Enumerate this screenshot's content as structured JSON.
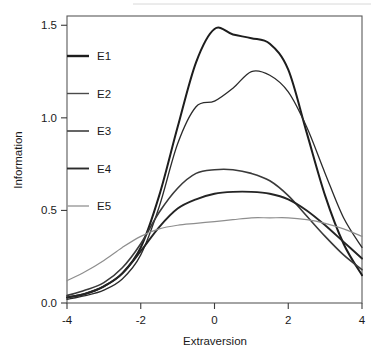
{
  "chart_data": {
    "type": "line",
    "title": "",
    "xlabel": "Extraversion",
    "ylabel": "Information",
    "xlim": [
      -4,
      4
    ],
    "ylim": [
      0.0,
      1.55
    ],
    "xticks": [
      -4,
      -2,
      0,
      2,
      4
    ],
    "xtick_labels": [
      "-4",
      "-2",
      "0",
      "2",
      "4"
    ],
    "yticks": [
      0.0,
      0.5,
      1.0,
      1.5
    ],
    "ytick_labels": [
      "0.0",
      "0.5",
      "1.0",
      "1.5"
    ],
    "grid": false,
    "legend_position": "upper-left-inside",
    "series": [
      {
        "name": "E1",
        "color": "#1d1d1d",
        "width": 2.0,
        "x": [
          -4.0,
          -3.5,
          -3.0,
          -2.5,
          -2.0,
          -1.5,
          -1.0,
          -0.5,
          0.0,
          0.5,
          1.0,
          1.5,
          2.0,
          2.5,
          3.0,
          3.5,
          4.0
        ],
        "y": [
          0.03,
          0.05,
          0.09,
          0.16,
          0.3,
          0.58,
          0.95,
          1.3,
          1.48,
          1.45,
          1.43,
          1.4,
          1.26,
          0.92,
          0.58,
          0.32,
          0.15
        ]
      },
      {
        "name": "E2",
        "color": "#2b2b2b",
        "width": 1.3,
        "x": [
          -4.0,
          -3.5,
          -3.0,
          -2.5,
          -2.0,
          -1.5,
          -1.0,
          -0.5,
          0.0,
          0.5,
          1.0,
          1.5,
          2.0,
          2.5,
          3.0,
          3.5,
          4.0
        ],
        "y": [
          0.02,
          0.04,
          0.07,
          0.13,
          0.26,
          0.52,
          0.86,
          1.06,
          1.09,
          1.16,
          1.25,
          1.23,
          1.14,
          0.95,
          0.7,
          0.46,
          0.3
        ]
      },
      {
        "name": "E3",
        "color": "#3a3a3a",
        "width": 1.6,
        "x": [
          -4.0,
          -3.5,
          -3.0,
          -2.5,
          -2.0,
          -1.5,
          -1.0,
          -0.5,
          0.0,
          0.5,
          1.0,
          1.5,
          2.0,
          2.5,
          3.0,
          3.5,
          4.0
        ],
        "y": [
          0.04,
          0.07,
          0.11,
          0.19,
          0.32,
          0.49,
          0.62,
          0.7,
          0.72,
          0.72,
          0.7,
          0.66,
          0.58,
          0.47,
          0.36,
          0.26,
          0.18
        ]
      },
      {
        "name": "E4",
        "color": "#242424",
        "width": 1.9,
        "x": [
          -4.0,
          -3.5,
          -3.0,
          -2.5,
          -2.0,
          -1.5,
          -1.0,
          -0.5,
          0.0,
          0.5,
          1.0,
          1.5,
          2.0,
          2.5,
          3.0,
          3.5,
          4.0
        ],
        "y": [
          0.03,
          0.05,
          0.09,
          0.16,
          0.28,
          0.41,
          0.51,
          0.56,
          0.59,
          0.6,
          0.6,
          0.59,
          0.56,
          0.5,
          0.42,
          0.33,
          0.24
        ]
      },
      {
        "name": "E5",
        "color": "#8e8e8e",
        "width": 1.2,
        "x": [
          -4.0,
          -3.5,
          -3.0,
          -2.5,
          -2.0,
          -1.5,
          -1.0,
          -0.5,
          0.0,
          0.5,
          1.0,
          1.5,
          2.0,
          2.5,
          3.0,
          3.5,
          4.0
        ],
        "y": [
          0.12,
          0.17,
          0.23,
          0.3,
          0.36,
          0.4,
          0.42,
          0.43,
          0.44,
          0.45,
          0.46,
          0.46,
          0.46,
          0.45,
          0.43,
          0.4,
          0.36
        ]
      }
    ],
    "legend": [
      {
        "label": "E1",
        "color": "#1d1d1d",
        "width": 2.4
      },
      {
        "label": "E2",
        "color": "#4a4a4a",
        "width": 1.4
      },
      {
        "label": "E3",
        "color": "#4a4a4a",
        "width": 1.7
      },
      {
        "label": "E4",
        "color": "#2b2b2b",
        "width": 1.9
      },
      {
        "label": "E5",
        "color": "#9a9a9a",
        "width": 1.4
      }
    ]
  }
}
